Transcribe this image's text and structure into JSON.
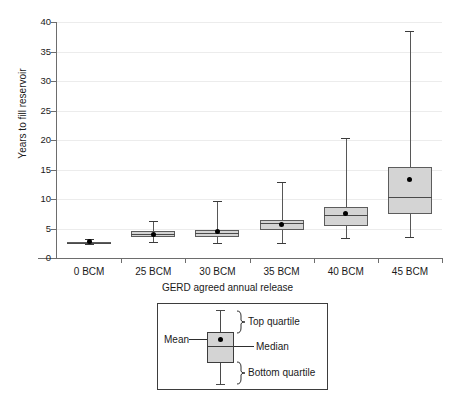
{
  "chart_data": {
    "type": "box",
    "title": "",
    "xlabel": "GERD agreed annual release",
    "ylabel": "Years to fill reservoir",
    "ylim": [
      0,
      40
    ],
    "ytick_labels": [
      "0",
      "5",
      "10",
      "15",
      "20",
      "25",
      "30",
      "35",
      "40"
    ],
    "ytick_values": [
      0,
      5,
      10,
      15,
      20,
      25,
      30,
      35,
      40
    ],
    "grid": "horizontal",
    "categories": [
      "0 BCM",
      "25 BCM",
      "30 BCM",
      "35 BCM",
      "40 BCM",
      "45 BCM"
    ],
    "boxes": [
      {
        "category": "0 BCM",
        "whisker_low": 2.3,
        "q1": 2.5,
        "median": 2.6,
        "q3": 2.7,
        "whisker_high": 3.2,
        "mean": 2.75
      },
      {
        "category": "25 BCM",
        "whisker_low": 2.7,
        "q1": 3.5,
        "median": 4.0,
        "q3": 4.5,
        "whisker_high": 6.2,
        "mean": 3.9
      },
      {
        "category": "30 BCM",
        "whisker_low": 2.6,
        "q1": 3.5,
        "median": 4.2,
        "q3": 4.7,
        "whisker_high": 9.7,
        "mean": 4.5
      },
      {
        "category": "35 BCM",
        "whisker_low": 2.5,
        "q1": 4.8,
        "median": 5.9,
        "q3": 6.4,
        "whisker_high": 12.8,
        "mean": 5.6
      },
      {
        "category": "40 BCM",
        "whisker_low": 3.4,
        "q1": 5.5,
        "median": 7.3,
        "q3": 8.7,
        "whisker_high": 20.3,
        "mean": 7.5
      },
      {
        "category": "45 BCM",
        "whisker_low": 3.5,
        "q1": 7.5,
        "median": 10.4,
        "q3": 15.4,
        "whisker_high": 38.5,
        "mean": 13.3
      }
    ],
    "legend_position": "below-axes",
    "colors": {
      "box_fill": "#d4d4d4",
      "box_edge": "#5c5c5c",
      "whisker": "#575757",
      "mean_dot": "#000000",
      "gridline": "#ececec",
      "axis": "#6d6d6d",
      "text": "#1a1a1a",
      "background": "#ffffff"
    }
  },
  "legend": {
    "mean_label": "Mean",
    "median_label": "Median",
    "top_quartile_label": "Top quartile",
    "bottom_quartile_label": "Bottom quartile"
  }
}
